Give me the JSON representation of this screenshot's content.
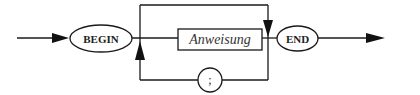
{
  "diagram": {
    "type": "syntax-diagram",
    "start_terminal": {
      "label": "BEGIN",
      "shape": "ellipse"
    },
    "nonterminal": {
      "label": "Anweisung",
      "shape": "rectangle"
    },
    "separator_terminal": {
      "label": ";",
      "shape": "circle"
    },
    "end_terminal": {
      "label": "END",
      "shape": "ellipse"
    },
    "colors": {
      "stroke": "#1a1a1a",
      "background": "#ffffff"
    }
  }
}
